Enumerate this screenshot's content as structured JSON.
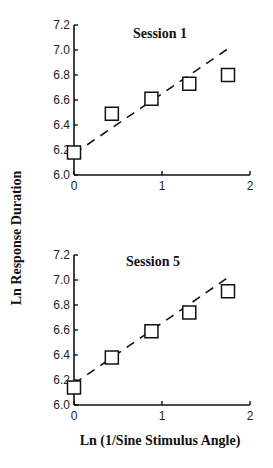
{
  "chart_data": [
    {
      "type": "scatter",
      "title": "Session 1",
      "xlabel": "Ln (1/Sine Stimulus Angle)",
      "ylabel": "Ln Response Duration",
      "xlim": [
        0,
        2
      ],
      "ylim": [
        6.0,
        7.2
      ],
      "x_ticks": [
        "0",
        "1",
        "2"
      ],
      "y_ticks": [
        "6.0",
        "6.2",
        "6.4",
        "6.6",
        "6.8",
        "7.0",
        "7.2"
      ],
      "grid": false,
      "marker": "open-square",
      "series": [
        {
          "name": "observed",
          "x": [
            0.0,
            0.43,
            0.88,
            1.31,
            1.75
          ],
          "y": [
            6.18,
            6.49,
            6.61,
            6.73,
            6.8
          ]
        },
        {
          "name": "fit (dashed)",
          "x": [
            0.0,
            1.75
          ],
          "y": [
            6.17,
            7.01
          ]
        }
      ]
    },
    {
      "type": "scatter",
      "title": "Session 5",
      "xlabel": "Ln (1/Sine Stimulus Angle)",
      "ylabel": "Ln Response Duration",
      "xlim": [
        0,
        2
      ],
      "ylim": [
        6.0,
        7.2
      ],
      "x_ticks": [
        "0",
        "1",
        "2"
      ],
      "y_ticks": [
        "6.0",
        "6.2",
        "6.4",
        "6.6",
        "6.8",
        "7.0",
        "7.2"
      ],
      "grid": false,
      "marker": "open-square",
      "series": [
        {
          "name": "observed",
          "x": [
            0.0,
            0.43,
            0.88,
            1.31,
            1.75
          ],
          "y": [
            6.14,
            6.38,
            6.59,
            6.74,
            6.91
          ]
        },
        {
          "name": "fit (dashed)",
          "x": [
            0.0,
            1.75
          ],
          "y": [
            6.17,
            7.02
          ]
        }
      ]
    }
  ],
  "labels": {
    "shared_ylabel": "Ln Response Duration",
    "shared_xlabel": "Ln (1/Sine Stimulus Angle)",
    "panel1_title": "Session 1",
    "panel2_title": "Session 5"
  }
}
